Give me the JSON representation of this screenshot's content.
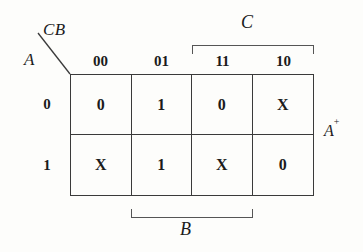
{
  "figure": {
    "kind": "karnaugh-map",
    "corner": {
      "top_label": "CB",
      "side_label": "A"
    },
    "output_label": "A",
    "output_superscript": "+",
    "column_header_label": "CB",
    "row_header_label": "A",
    "columns": [
      "00",
      "01",
      "11",
      "10"
    ],
    "rows": [
      "0",
      "1"
    ],
    "cells": [
      [
        "0",
        "1",
        "0",
        "X"
      ],
      [
        "X",
        "1",
        "X",
        "0"
      ]
    ],
    "brackets": [
      {
        "name": "C",
        "label": "C",
        "position": "top",
        "spans_columns": [
          "11",
          "10"
        ]
      },
      {
        "name": "B",
        "label": "B",
        "position": "bottom",
        "spans_columns": [
          "01",
          "11"
        ]
      }
    ],
    "colors": {
      "background": "#fdfdfb",
      "ink": "#1b1b1b",
      "grid_line": "#3a3a3a",
      "bracket_line": "#555555"
    }
  }
}
